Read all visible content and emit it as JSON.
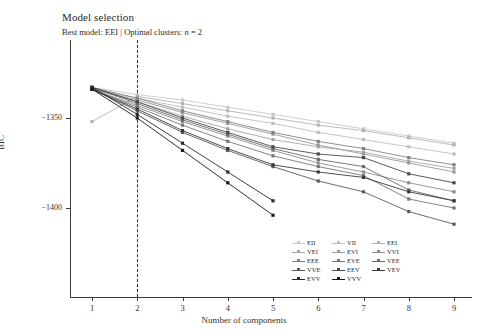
{
  "chart_data": {
    "type": "line",
    "title": "Model selection",
    "subtitle_prefix": "Best model: EEI | Optimal clusters: ",
    "subtitle_italic": "n",
    "subtitle_suffix": " = 2",
    "best_model": "EEI",
    "optimal_clusters": 2,
    "xlabel": "Number of components",
    "ylabel": "BIC",
    "x": [
      1,
      2,
      3,
      4,
      5,
      6,
      7,
      8,
      9
    ],
    "xticklabels": [
      "1",
      "2",
      "3",
      "4",
      "5",
      "6",
      "7",
      "8",
      "9"
    ],
    "yticks": [
      -1350,
      -1400
    ],
    "yticklabels": [
      "−1350",
      "−1400"
    ],
    "ylim": [
      -1420,
      -1330
    ],
    "xlim": [
      0.6,
      9.4
    ],
    "grid": false,
    "legend_position": "bottom-right",
    "vline_at_x": 2,
    "vline_style": "dashed",
    "series": [
      {
        "name": "EII",
        "color": "#c9c9c9",
        "values": [
          -1333,
          -1337,
          -1340,
          -1344,
          -1348,
          -1352,
          -1356,
          -1360,
          -1364
        ]
      },
      {
        "name": "VII",
        "color": "#bdbdbd",
        "values": [
          -1334,
          -1339,
          -1344,
          -1349,
          -1353,
          -1358,
          -1362,
          -1366,
          -1370
        ]
      },
      {
        "name": "EEI",
        "color": "#b3b3b3",
        "values": [
          -1352,
          -1338,
          -1342,
          -1346,
          -1350,
          -1354,
          -1357,
          -1361,
          -1365
        ]
      },
      {
        "name": "VEI",
        "color": "#a6a6a6",
        "values": [
          -1333,
          -1341,
          -1349,
          -1356,
          -1362,
          -1366,
          -1369,
          -1374,
          -1378
        ]
      },
      {
        "name": "EVI",
        "color": "#9a9a9a",
        "values": [
          -1334,
          -1340,
          -1347,
          -1353,
          -1359,
          -1365,
          -1370,
          -1375,
          -1380
        ]
      },
      {
        "name": "VVI",
        "color": "#8e8e8e",
        "values": [
          -1334,
          -1343,
          -1352,
          -1360,
          -1368,
          -1375,
          -1380,
          -1386,
          -1391
        ]
      },
      {
        "name": "EEE",
        "color": "#828282",
        "values": [
          -1333,
          -1339,
          -1346,
          -1352,
          -1358,
          -1363,
          -1367,
          -1372,
          -1376
        ]
      },
      {
        "name": "EVE",
        "color": "#767676",
        "values": [
          -1334,
          -1344,
          -1354,
          -1363,
          -1371,
          -1377,
          -1382,
          -1395,
          -1400
        ]
      },
      {
        "name": "VEE",
        "color": "#6a6a6a",
        "values": [
          -1333,
          -1342,
          -1351,
          -1359,
          -1367,
          -1373,
          -1377,
          -1390,
          -1396
        ]
      },
      {
        "name": "VVE",
        "color": "#5a5a5a",
        "values": [
          -1334,
          -1346,
          -1358,
          -1368,
          -1377,
          -1385,
          -1391,
          -1402,
          -1409
        ]
      },
      {
        "name": "EEV",
        "color": "#4a4a4a",
        "values": [
          -1333,
          -1341,
          -1350,
          -1358,
          -1366,
          -1370,
          -1372,
          -1381,
          -1386
        ]
      },
      {
        "name": "VEV",
        "color": "#3a3a3a",
        "values": [
          -1334,
          -1345,
          -1357,
          -1367,
          -1376,
          -1380,
          -1383,
          -1391,
          -1396
        ]
      },
      {
        "name": "EVV",
        "color": "#2a2a2a",
        "values": [
          -1333,
          -1348,
          -1364,
          -1380,
          -1396,
          null,
          null,
          null,
          null
        ]
      },
      {
        "name": "VVV",
        "color": "#1a1a1a",
        "values": [
          -1334,
          -1350,
          -1368,
          -1386,
          -1404,
          null,
          null,
          null,
          null
        ]
      }
    ]
  },
  "legend": {
    "items": [
      "EII",
      "VII",
      "EEI",
      "VEI",
      "EVI",
      "VVI",
      "EEE",
      "EVE",
      "VEE",
      "VVE",
      "EEV",
      "VEV",
      "EVV",
      "VVV"
    ]
  }
}
